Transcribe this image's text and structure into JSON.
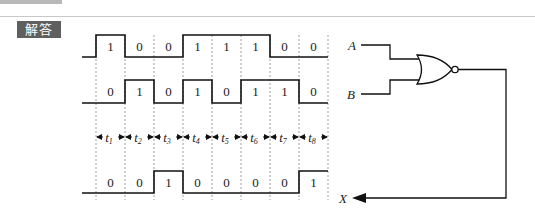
{
  "header": {
    "badge_label": "解答"
  },
  "diagram": {
    "signals": [
      {
        "name": "A",
        "bits": [
          "1",
          "0",
          "0",
          "1",
          "1",
          "1",
          "0",
          "0"
        ]
      },
      {
        "name": "B",
        "bits": [
          "0",
          "1",
          "0",
          "1",
          "0",
          "1",
          "1",
          "0"
        ]
      },
      {
        "name": "X",
        "bits": [
          "0",
          "0",
          "1",
          "0",
          "0",
          "0",
          "0",
          "1"
        ]
      }
    ],
    "intervals": [
      "t1",
      "t2",
      "t3",
      "t4",
      "t5",
      "t6",
      "t7",
      "t8"
    ],
    "interval_subscripts": [
      "1",
      "2",
      "3",
      "4",
      "5",
      "6",
      "7",
      "8"
    ],
    "gate": {
      "type": "NOR",
      "inputs": [
        "A",
        "B"
      ],
      "output": "X"
    },
    "labels": {
      "a": "A",
      "b": "B",
      "x": "X",
      "t": "t"
    }
  }
}
